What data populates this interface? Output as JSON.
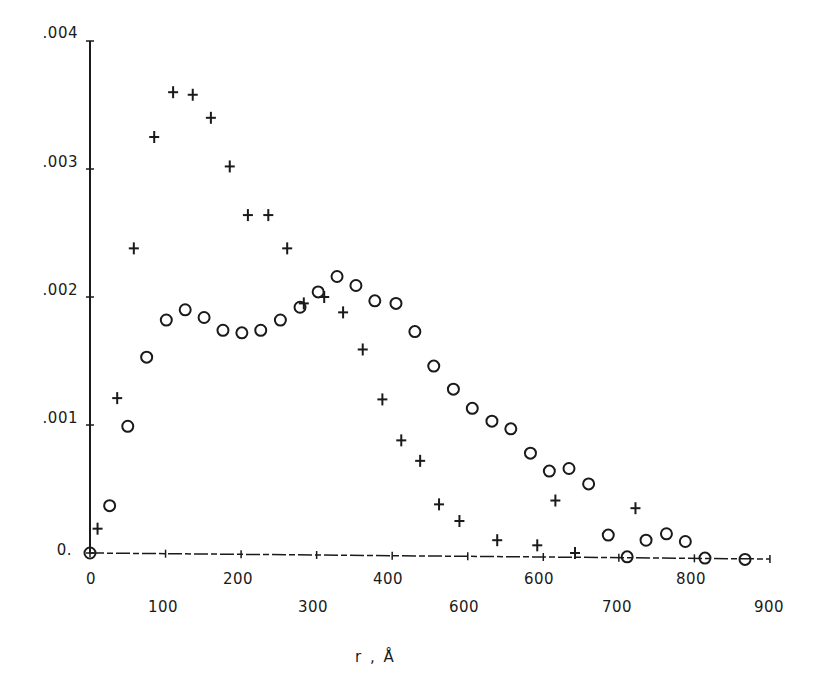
{
  "chart_data": {
    "type": "scatter",
    "title": "",
    "xlabel": "r , Å",
    "ylabel": "",
    "xlim": [
      0,
      900
    ],
    "ylim": [
      0,
      0.004
    ],
    "grid": false,
    "legend": null,
    "x_ticks": [
      0,
      100,
      200,
      300,
      400,
      500,
      600,
      700,
      800,
      900
    ],
    "x_tick_labels": [
      "0",
      "100",
      "200",
      "300",
      "400",
      "600",
      "600",
      "700",
      "800",
      "900"
    ],
    "y_ticks": [
      0,
      0.001,
      0.002,
      0.003,
      0.004
    ],
    "y_tick_labels": [
      "0.",
      ".001",
      ".002",
      ".003",
      ".004"
    ],
    "series": [
      {
        "name": "plus markers",
        "marker": "plus",
        "x": [
          10,
          36,
          58,
          85,
          110,
          136,
          160,
          185,
          209,
          236,
          261,
          283,
          310,
          335,
          361,
          387,
          412,
          437,
          462,
          489,
          539,
          592,
          616,
          642,
          722
        ],
        "y": [
          0.00019,
          0.00121,
          0.00238,
          0.00325,
          0.0036,
          0.00358,
          0.0034,
          0.00302,
          0.00264,
          0.00264,
          0.00238,
          0.00195,
          0.002,
          0.00188,
          0.00159,
          0.0012,
          0.00088,
          0.00072,
          0.00038,
          0.00025,
          0.0001,
          6e-05,
          0.00041,
          0.0,
          0.00035
        ]
      },
      {
        "name": "circle markers",
        "marker": "circle",
        "x": [
          0,
          26,
          50,
          75,
          101,
          126,
          151,
          176,
          201,
          226,
          252,
          278,
          302,
          327,
          352,
          377,
          405,
          430,
          455,
          481,
          506,
          532,
          557,
          583,
          608,
          634,
          660,
          686,
          711,
          736,
          763,
          788,
          814,
          867
        ],
        "y": [
          0.0,
          0.00037,
          0.00099,
          0.00153,
          0.00182,
          0.0019,
          0.00184,
          0.00174,
          0.00172,
          0.00174,
          0.00182,
          0.00192,
          0.00204,
          0.00216,
          0.00209,
          0.00197,
          0.00195,
          0.00173,
          0.00146,
          0.00128,
          0.00113,
          0.00103,
          0.00097,
          0.00078,
          0.00064,
          0.00066,
          0.00054,
          0.00014,
          -3e-05,
          0.0001,
          0.00015,
          9e-05,
          -4e-05,
          -5e-05
        ]
      }
    ]
  },
  "axes": {
    "x_title": "r , Å",
    "y_labels": {
      "l0": "0.",
      "l1": ".001",
      "l2": ".002",
      "l3": ".003",
      "l4": ".004"
    },
    "x_labels": {
      "l0": "0",
      "l100": "100",
      "l200": "200",
      "l300": "300",
      "l400": "400",
      "l500": "600",
      "l600": "600",
      "l700": "700",
      "l800": "800",
      "l900": "900"
    }
  },
  "colors": {
    "ink": "#1a1a1a",
    "background": "#ffffff"
  }
}
